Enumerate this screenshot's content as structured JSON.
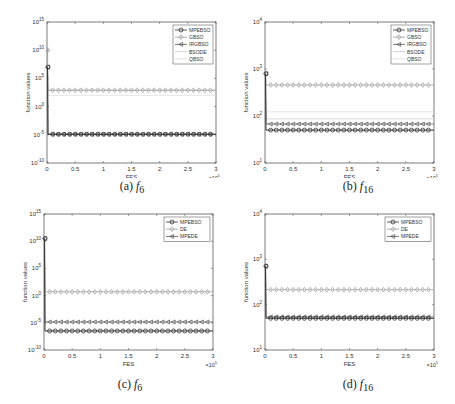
{
  "chart_data": [
    {
      "id": "a",
      "type": "line",
      "caption_prefix": "(a)",
      "caption_func": "f",
      "caption_sub": "6",
      "xlabel": "FES",
      "ylabel": "function values",
      "x_multiplier": "×10^5",
      "xlim": [
        0,
        3
      ],
      "xticks": [
        "0",
        "0.5",
        "1",
        "1.5",
        "2",
        "2.5",
        "3"
      ],
      "yscale": "log",
      "ylim_exp": [
        -10,
        15
      ],
      "yticks": [
        "10^-10",
        "10^-5",
        "10^0",
        "10^5",
        "10^10",
        "10^15"
      ],
      "legend_position": "upper right",
      "series": [
        {
          "name": "MPEBSO",
          "marker": "o",
          "color": "#333333",
          "initial_exp": 7.0,
          "final_exp": -4.9
        },
        {
          "name": "GBSO",
          "marker": "diamond",
          "color": "#9a9a9a",
          "initial_exp": 10.0,
          "final_exp": 2.9
        },
        {
          "name": "IRGBSO",
          "marker": "<",
          "color": "#555555",
          "initial_exp": 7.0,
          "final_exp": -4.9
        },
        {
          "name": "BSODE",
          "marker": "none",
          "color": "#c8c8c8",
          "initial_exp": 7.0,
          "final_exp": 2.9
        },
        {
          "name": "QBSO",
          "marker": "none",
          "color": "#d8d8d8",
          "initial_exp": 7.0,
          "final_exp": 2.0
        }
      ]
    },
    {
      "id": "b",
      "type": "line",
      "caption_prefix": "(b)",
      "caption_func": "f",
      "caption_sub": "16",
      "xlabel": "FES",
      "ylabel": "function values",
      "x_multiplier": "×10^5",
      "xlim": [
        0,
        3
      ],
      "xticks": [
        "0",
        "0.5",
        "1",
        "1.5",
        "2",
        "2.5",
        "3"
      ],
      "yscale": "log",
      "ylim_exp": [
        1,
        4
      ],
      "yticks": [
        "10^1",
        "10^2",
        "10^3",
        "10^4"
      ],
      "legend_position": "upper right",
      "series": [
        {
          "name": "MPEBSO",
          "marker": "o",
          "color": "#333333",
          "initial_exp": 2.9,
          "final_exp": 1.7
        },
        {
          "name": "GBSO",
          "marker": "diamond",
          "color": "#9a9a9a",
          "initial_exp": 2.9,
          "final_exp": 2.66
        },
        {
          "name": "IRGBSO",
          "marker": "<",
          "color": "#555555",
          "initial_exp": 2.9,
          "final_exp": 1.83
        },
        {
          "name": "BSODE",
          "marker": "none",
          "color": "#c8c8c8",
          "initial_exp": 2.9,
          "final_exp": 1.94
        },
        {
          "name": "QBSO",
          "marker": "none",
          "color": "#d8d8d8",
          "initial_exp": 2.9,
          "final_exp": 2.09
        }
      ]
    },
    {
      "id": "c",
      "type": "line",
      "caption_prefix": "(c)",
      "caption_func": "f",
      "caption_sub": "6",
      "xlabel": "FES",
      "ylabel": "function values",
      "x_multiplier": "×10^5",
      "xlim": [
        0,
        3
      ],
      "xticks": [
        "0",
        "0.5",
        "1",
        "1.5",
        "2",
        "2.5",
        "3"
      ],
      "yscale": "log",
      "ylim_exp": [
        -10,
        15
      ],
      "yticks": [
        "10^-10",
        "10^-5",
        "10^0",
        "10^5",
        "10^10",
        "10^15"
      ],
      "legend_position": "upper right",
      "series": [
        {
          "name": "MPEBSO",
          "marker": "o",
          "color": "#333333",
          "initial_exp": 10.5,
          "final_exp": -6.5
        },
        {
          "name": "DE",
          "marker": "diamond",
          "color": "#9a9a9a",
          "initial_exp": 10.5,
          "final_exp": 0.7
        },
        {
          "name": "MPEDE",
          "marker": "<",
          "color": "#555555",
          "initial_exp": 10.5,
          "final_exp": -4.85
        }
      ]
    },
    {
      "id": "d",
      "type": "line",
      "caption_prefix": "(d)",
      "caption_func": "f",
      "caption_sub": "16",
      "xlabel": "FES",
      "ylabel": "function values",
      "x_multiplier": "×10^5",
      "xlim": [
        0,
        3
      ],
      "xticks": [
        "0",
        "0.5",
        "1",
        "1.5",
        "2",
        "2.5",
        "3"
      ],
      "yscale": "log",
      "ylim_exp": [
        1,
        4
      ],
      "yticks": [
        "10^1",
        "10^2",
        "10^3",
        "10^4"
      ],
      "legend_position": "upper right",
      "series": [
        {
          "name": "MPEBSO",
          "marker": "o",
          "color": "#333333",
          "initial_exp": 2.85,
          "final_exp": 1.7
        },
        {
          "name": "DE",
          "marker": "diamond",
          "color": "#9a9a9a",
          "initial_exp": 2.85,
          "final_exp": 2.33
        },
        {
          "name": "MPEDE",
          "marker": "<",
          "color": "#555555",
          "initial_exp": 2.85,
          "final_exp": 1.73
        }
      ]
    }
  ]
}
